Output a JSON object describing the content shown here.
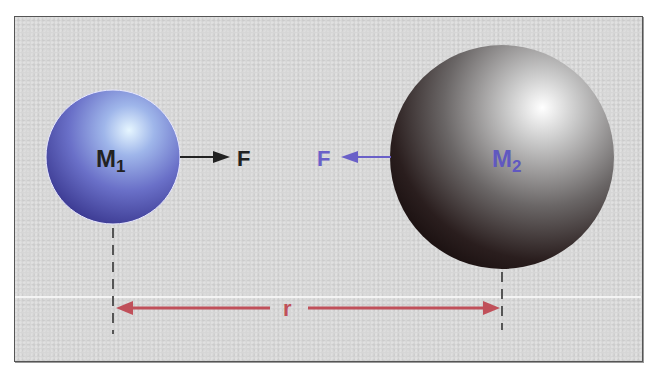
{
  "diagram": {
    "mass1": {
      "label": "M",
      "subscript": "1",
      "color": "#6a70c8",
      "label_color": "#222222"
    },
    "mass2": {
      "label": "M",
      "subscript": "2",
      "color": "#555555",
      "label_color": "#6058c0"
    },
    "force1": {
      "label": "F",
      "direction": "right",
      "color": "#222222"
    },
    "force2": {
      "label": "F",
      "direction": "left",
      "color": "#6a60c8"
    },
    "distance": {
      "label": "r",
      "color": "#c0505a"
    },
    "colors": {
      "background": "#d6d6d6",
      "frame_border": "#555555",
      "dashed": "#555555"
    }
  }
}
